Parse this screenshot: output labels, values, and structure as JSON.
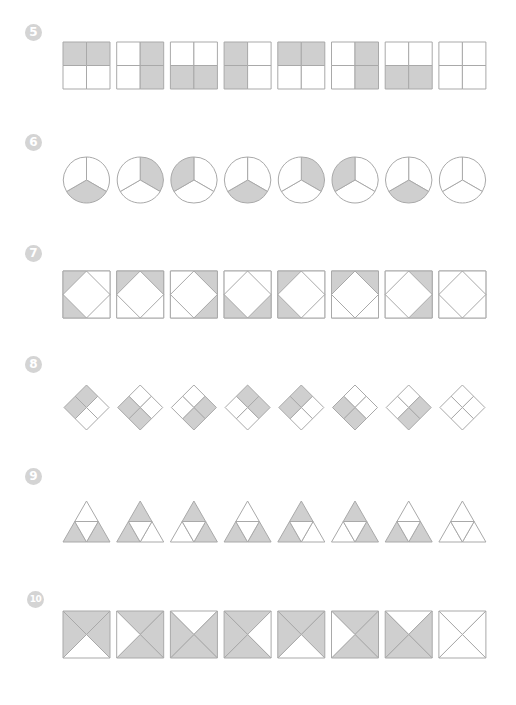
{
  "colors": {
    "fill": "#cfcfcf",
    "stroke": "#a9a9a9",
    "badge": "#d4d4d4"
  },
  "layout": {
    "x0": 63,
    "pitch": 53.7,
    "size": 47
  },
  "problems": [
    {
      "number": "5",
      "shape": "square-quarters",
      "badge_y": 24,
      "top": 42,
      "items": [
        [
          "tl",
          "tr"
        ],
        [
          "tr",
          "br"
        ],
        [
          "bl",
          "br"
        ],
        [
          "tl",
          "bl"
        ],
        [
          "tl",
          "tr"
        ],
        [
          "tr",
          "br"
        ],
        [
          "bl",
          "br"
        ],
        []
      ]
    },
    {
      "number": "6",
      "shape": "circle-thirds",
      "badge_y": 134,
      "top": 157,
      "items": [
        [
          "bottom"
        ],
        [
          "right"
        ],
        [
          "left"
        ],
        [
          "bottom"
        ],
        [
          "right"
        ],
        [
          "left"
        ],
        [
          "bottom"
        ],
        []
      ]
    },
    {
      "number": "7",
      "shape": "square-corners",
      "badge_y": 245,
      "top": 271,
      "items": [
        [
          "tl",
          "bl"
        ],
        [
          "tl",
          "tr"
        ],
        [
          "tr",
          "br"
        ],
        [
          "bl",
          "br"
        ],
        [
          "tl",
          "bl"
        ],
        [
          "tl",
          "tr"
        ],
        [
          "tr",
          "br"
        ],
        []
      ]
    },
    {
      "number": "8",
      "shape": "diamond-quarters",
      "badge_y": 356,
      "top": 385,
      "items": [
        [
          "top",
          "left"
        ],
        [
          "left",
          "bottom"
        ],
        [
          "right",
          "bottom"
        ],
        [
          "top",
          "right"
        ],
        [
          "top",
          "left"
        ],
        [
          "left",
          "bottom"
        ],
        [
          "right",
          "bottom"
        ],
        []
      ]
    },
    {
      "number": "9",
      "shape": "triangle-quarters",
      "badge_y": 468,
      "top": 497,
      "items": [
        [
          "bl",
          "br"
        ],
        [
          "top",
          "bl"
        ],
        [
          "top",
          "br"
        ],
        [
          "bl",
          "br"
        ],
        [
          "top",
          "bl"
        ],
        [
          "top",
          "br"
        ],
        [
          "bl",
          "br"
        ],
        []
      ]
    },
    {
      "number": "10",
      "shape": "square-x-triangles",
      "badge_y": 591,
      "top": 611,
      "items": [
        [
          "top",
          "left",
          "right"
        ],
        [
          "top",
          "right",
          "bottom"
        ],
        [
          "left",
          "right",
          "bottom"
        ],
        [
          "top",
          "left",
          "bottom"
        ],
        [
          "top",
          "left",
          "right"
        ],
        [
          "top",
          "right",
          "bottom"
        ],
        [
          "left",
          "right",
          "bottom"
        ],
        []
      ]
    }
  ],
  "footer": {
    "text": ""
  }
}
